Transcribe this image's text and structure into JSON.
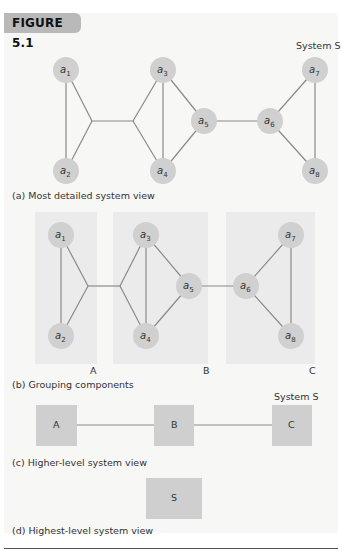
{
  "figure": {
    "title": "FIGURE 5.1",
    "colors": {
      "frame_bg": "#f7f7f6",
      "tab_bg": "#b9b9b9",
      "node_fill": "#d0d0d0",
      "panel_fill": "#ebebeb",
      "box_fill": "#cfcfcf",
      "edge": "#8a8a8a"
    }
  },
  "panel_a": {
    "system_label": "System S",
    "caption": "(a) Most detailed system view",
    "nodes": [
      {
        "id": "a1",
        "base": "a",
        "sub": "1",
        "x": 66,
        "y": 70
      },
      {
        "id": "a2",
        "base": "a",
        "sub": "2",
        "x": 66,
        "y": 171
      },
      {
        "id": "a3",
        "base": "a",
        "sub": "3",
        "x": 163,
        "y": 70
      },
      {
        "id": "a4",
        "base": "a",
        "sub": "4",
        "x": 163,
        "y": 171
      },
      {
        "id": "a5",
        "base": "a",
        "sub": "5",
        "x": 204,
        "y": 121
      },
      {
        "id": "a6",
        "base": "a",
        "sub": "6",
        "x": 270,
        "y": 121
      },
      {
        "id": "a7",
        "base": "a",
        "sub": "7",
        "x": 315,
        "y": 70
      },
      {
        "id": "a8",
        "base": "a",
        "sub": "8",
        "x": 315,
        "y": 171
      }
    ]
  },
  "panel_b": {
    "caption": "(b) Grouping components",
    "groups": [
      {
        "label": "A",
        "members": [
          "a1",
          "a2"
        ]
      },
      {
        "label": "B",
        "members": [
          "a3",
          "a4",
          "a5"
        ]
      },
      {
        "label": "C",
        "members": [
          "a6",
          "a7",
          "a8"
        ]
      }
    ],
    "nodes": [
      {
        "id": "a1",
        "base": "a",
        "sub": "1",
        "x": 61,
        "y": 235
      },
      {
        "id": "a2",
        "base": "a",
        "sub": "2",
        "x": 61,
        "y": 336
      },
      {
        "id": "a3",
        "base": "a",
        "sub": "3",
        "x": 146,
        "y": 235
      },
      {
        "id": "a4",
        "base": "a",
        "sub": "4",
        "x": 146,
        "y": 336
      },
      {
        "id": "a5",
        "base": "a",
        "sub": "5",
        "x": 189,
        "y": 286
      },
      {
        "id": "a6",
        "base": "a",
        "sub": "6",
        "x": 246,
        "y": 286
      },
      {
        "id": "a7",
        "base": "a",
        "sub": "7",
        "x": 291,
        "y": 235
      },
      {
        "id": "a8",
        "base": "a",
        "sub": "8",
        "x": 291,
        "y": 336
      }
    ]
  },
  "panel_c": {
    "system_label": "System S",
    "caption": "(c) Higher-level system view",
    "boxes": [
      {
        "label": "A"
      },
      {
        "label": "B"
      },
      {
        "label": "C"
      }
    ]
  },
  "panel_d": {
    "caption": "(d) Highest-level system view",
    "box_label": "S"
  }
}
